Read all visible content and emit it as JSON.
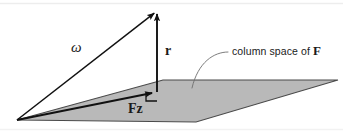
{
  "figure": {
    "width": 343,
    "height": 132,
    "background_color": "#ffffff"
  },
  "colors": {
    "plane_fill": "#b9b9b9",
    "plane_stroke": "#4a4a4a",
    "vector_stroke": "#111111",
    "leader_stroke": "#6e6e6e",
    "text": "#1a1a1a",
    "frame": "#e8e8e8"
  },
  "labels": {
    "omega": "ω",
    "residual": "r",
    "projection": "Fz",
    "column_space_prefix": "column space of ",
    "column_space_matrix": "F"
  },
  "geometry": {
    "origin": {
      "x": 17,
      "y": 120
    },
    "apex": {
      "x": 157,
      "y": 11
    },
    "foot": {
      "x": 157,
      "y": 92
    },
    "plane_points": "17,120 163,80 338,80 196,122",
    "right_angle_marker": "146,92 146,101 157,101",
    "leader_path": "M 228,52 C 214,52 198,62 192,88"
  },
  "annotations": {
    "omega_vector": "vector omega from origin to apex",
    "residual_vector": "vertical residual vector r from plane to apex",
    "projection_vector": "projection vector Fz lying within the plane",
    "right_angle": "right angle between r and the plane",
    "leader": "curved leader line pointing to the shaded plane"
  }
}
